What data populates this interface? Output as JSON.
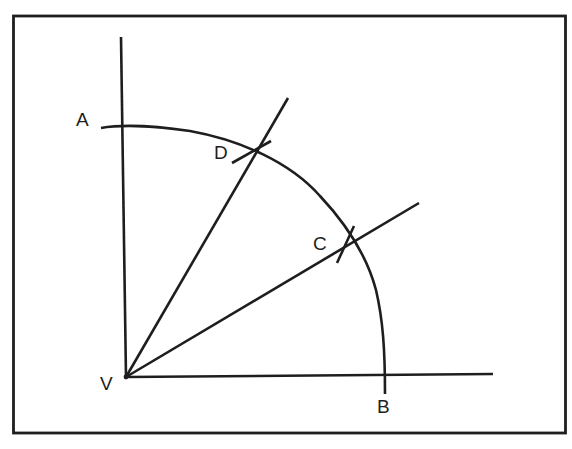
{
  "diagram": {
    "type": "geometric-construction",
    "colors": {
      "stroke": "#1e1e1e",
      "background": "#ffffff"
    },
    "labels": {
      "A": "A",
      "B": "B",
      "C": "C",
      "D": "D",
      "V": "V"
    },
    "points": [
      {
        "id": "V",
        "role": "vertex"
      },
      {
        "id": "A",
        "role": "arc end on vertical ray"
      },
      {
        "id": "B",
        "role": "arc end on horizontal ray"
      },
      {
        "id": "C",
        "role": "arc intersection, lower trisector"
      },
      {
        "id": "D",
        "role": "arc intersection, upper trisector"
      }
    ],
    "lines": [
      {
        "id": "vertical-ray",
        "from": "V",
        "direction": "up"
      },
      {
        "id": "horizontal-ray",
        "from": "V",
        "direction": "right"
      },
      {
        "id": "ray-VD",
        "from": "V",
        "through": "D"
      },
      {
        "id": "ray-VC",
        "from": "V",
        "through": "C"
      }
    ],
    "arcs": [
      {
        "id": "arc-AB",
        "center": "V",
        "from": "A",
        "to": "B"
      }
    ]
  }
}
